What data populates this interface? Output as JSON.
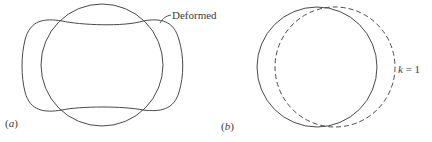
{
  "figure": {
    "panels": [
      {
        "id": "a",
        "label": "(a)",
        "label_letter": "a",
        "annotation": "Deformed",
        "shapes": [
          "undeformed circle (solid)",
          "deformed shape (solid)"
        ]
      },
      {
        "id": "b",
        "label": "(b)",
        "label_letter": "b",
        "annotation": "k = 1",
        "annotation_var": "k",
        "annotation_eq": "= 1",
        "shapes": [
          "undeformed circle (solid)",
          "shifted circle (dashed)"
        ]
      }
    ],
    "colors": {
      "stroke": "#4a4a4a",
      "text": "#3a3a3a",
      "background": "#ffffff"
    }
  }
}
